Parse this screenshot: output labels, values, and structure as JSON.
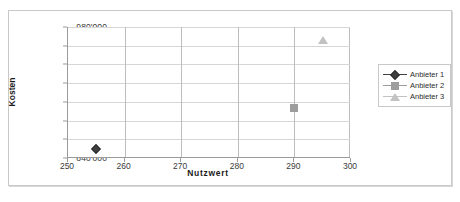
{
  "chart_data": {
    "type": "scatter",
    "title": "",
    "xlabel": "Nutzwert",
    "ylabel": "Kosten",
    "xlim": [
      250,
      300
    ],
    "ylim": [
      840000,
      980000
    ],
    "xticks": [
      "250",
      "260",
      "270",
      "280",
      "290",
      "300"
    ],
    "xtick_values": [
      250,
      260,
      270,
      280,
      290,
      300
    ],
    "yticks": [
      "840'000",
      "860'000",
      "880'000",
      "900'000",
      "920'000",
      "940'000",
      "960'000",
      "980'000"
    ],
    "ytick_values": [
      840000,
      860000,
      880000,
      900000,
      920000,
      940000,
      960000,
      980000
    ],
    "grid": "both",
    "legend_position": "right",
    "series": [
      {
        "name": "Anbieter 1",
        "marker": "diamond",
        "color": "#404040",
        "points": [
          {
            "x": 255,
            "y": 850000
          }
        ]
      },
      {
        "name": "Anbieter 2",
        "marker": "square",
        "color": "#9d9d9d",
        "points": [
          {
            "x": 290,
            "y": 893000
          }
        ]
      },
      {
        "name": "Anbieter 3",
        "marker": "triangle",
        "color": "#c2c2c2",
        "points": [
          {
            "x": 295,
            "y": 966000
          }
        ]
      }
    ]
  },
  "legend": {
    "items": [
      {
        "label": "Anbieter 1"
      },
      {
        "label": "Anbieter 2"
      },
      {
        "label": "Anbieter 3"
      }
    ]
  },
  "colors": {
    "series_1": "#404040",
    "series_2": "#9d9d9d",
    "series_3": "#c2c2c2",
    "grid": "#d6d6d6",
    "axis": "#9a9a9a",
    "frame": "#c9c9c9"
  }
}
